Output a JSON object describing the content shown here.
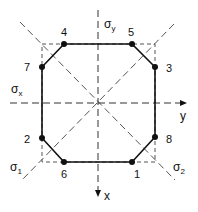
{
  "diagram": {
    "axes": {
      "x_label": "x",
      "y_label": "y",
      "sigma_x": {
        "base": "σ",
        "sub": "x"
      },
      "sigma_y": {
        "base": "σ",
        "sub": "y"
      },
      "sigma_1": {
        "base": "σ",
        "sub": "1"
      },
      "sigma_2": {
        "base": "σ",
        "sub": "2"
      }
    },
    "points": [
      {
        "label": "1",
        "x": 132,
        "y": 162
      },
      {
        "label": "2",
        "x": 42,
        "y": 138
      },
      {
        "label": "3",
        "x": 155,
        "y": 67
      },
      {
        "label": "4",
        "x": 64,
        "y": 44
      },
      {
        "label": "5",
        "x": 132,
        "y": 44
      },
      {
        "label": "6",
        "x": 64,
        "y": 162
      },
      {
        "label": "7",
        "x": 42,
        "y": 67
      },
      {
        "label": "8",
        "x": 155,
        "y": 137
      }
    ],
    "colors": {
      "line": "#111111",
      "dashed": "#444444"
    }
  }
}
